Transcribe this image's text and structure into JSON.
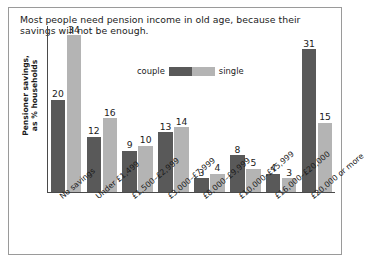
{
  "chart_data": {
    "type": "bar",
    "title": "Most people need pension income in old age, because their savings will not be enough.",
    "xlabel": "",
    "ylabel": "Pensioner savings, as % households",
    "ylabel_line1": "Pensioner savings,",
    "ylabel_line2": "as % households",
    "ylim": [
      0,
      36
    ],
    "grid": false,
    "legend_position": "top-center",
    "categories": [
      "No savings",
      "Under £1,499",
      "£1,500–£2,999",
      "£3,000–£7,999",
      "£8,000–£9,999",
      "£10,000–£15,999",
      "£16,000–£20,000",
      "£20,000 or more"
    ],
    "series": [
      {
        "name": "couple",
        "color": "#595959",
        "values": [
          20,
          12,
          9,
          13,
          3,
          8,
          4,
          31
        ]
      },
      {
        "name": "single",
        "color": "#b4b4b4",
        "values": [
          34,
          16,
          10,
          14,
          4,
          5,
          3,
          15
        ]
      }
    ]
  },
  "legend": {
    "left_label": "couple",
    "right_label": "single"
  }
}
